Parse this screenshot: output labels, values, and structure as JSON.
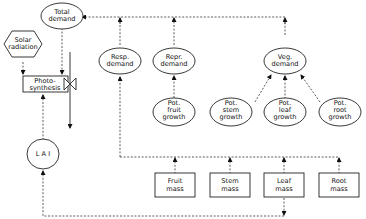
{
  "diagram": {
    "nodes": {
      "total_demand": {
        "line1": "Total",
        "line2": "demand"
      },
      "solar_radiation": {
        "line1": "Solar",
        "line2": "radiation"
      },
      "photosynthesis": {
        "line1": "Photo-",
        "line2": "synthesis"
      },
      "lai": {
        "label": "L A I"
      },
      "resp_demand": {
        "line1": "Resp.",
        "line2": "demand"
      },
      "repr_demand": {
        "line1": "Repr.",
        "line2": "demand"
      },
      "veg_demand": {
        "line1": "Veg.",
        "line2": "demand"
      },
      "pot_fruit_growth": {
        "line1": "Pot.",
        "line2": "fruit",
        "line3": "growth"
      },
      "pot_stem_growth": {
        "line1": "Pot.",
        "line2": "stem",
        "line3": "growth"
      },
      "pot_leaf_growth": {
        "line1": "Pot.",
        "line2": "leaf",
        "line3": "growth"
      },
      "pot_root_growth": {
        "line1": "Pot.",
        "line2": "root",
        "line3": "growth"
      },
      "fruit_mass": {
        "line1": "Fruit",
        "line2": "mass"
      },
      "stem_mass": {
        "line1": "Stem",
        "line2": "mass"
      },
      "leaf_mass": {
        "line1": "Leaf",
        "line2": "mass"
      },
      "root_mass": {
        "line1": "Root",
        "line2": "mass"
      }
    },
    "edges": [
      {
        "from": "solar_radiation",
        "to": "photosynthesis",
        "style": "dashed"
      },
      {
        "from": "total_demand",
        "to": "photosynthesis",
        "style": "dashed"
      },
      {
        "from": "lai",
        "to": "photosynthesis",
        "style": "dashed"
      },
      {
        "from": "resp_demand",
        "to": "total_demand",
        "style": "dashed"
      },
      {
        "from": "repr_demand",
        "to": "total_demand",
        "style": "dashed"
      },
      {
        "from": "veg_demand",
        "to": "total_demand",
        "style": "dashed"
      },
      {
        "from": "pot_fruit_growth",
        "to": "repr_demand",
        "style": "dashed"
      },
      {
        "from": "pot_stem_growth",
        "to": "veg_demand",
        "style": "dashed"
      },
      {
        "from": "pot_leaf_growth",
        "to": "veg_demand",
        "style": "dashed"
      },
      {
        "from": "pot_root_growth",
        "to": "veg_demand",
        "style": "dashed"
      },
      {
        "from": "fruit_mass",
        "to": "resp_demand",
        "style": "dashed"
      },
      {
        "from": "stem_mass",
        "to": "resp_demand",
        "style": "dashed"
      },
      {
        "from": "leaf_mass",
        "to": "resp_demand",
        "style": "dashed"
      },
      {
        "from": "root_mass",
        "to": "resp_demand",
        "style": "dashed"
      },
      {
        "from": "leaf_mass",
        "to": "lai",
        "style": "dashed"
      }
    ]
  }
}
